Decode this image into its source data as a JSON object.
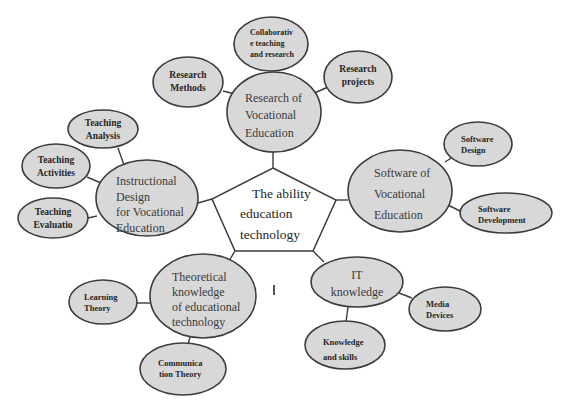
{
  "diagram": {
    "center": {
      "line1": "The  ability",
      "line2": "education",
      "line3": "technology"
    },
    "branches": {
      "research": {
        "line1": "Research of",
        "line2": "Vocational",
        "line3": "Education",
        "children": {
          "methods": {
            "line1": "Research",
            "line2": "Methods"
          },
          "collaborative": {
            "line1": "Collaborativ",
            "line2": "e teaching",
            "line3": "and research"
          },
          "projects": {
            "line1": "Research",
            "line2": "projects"
          }
        }
      },
      "software": {
        "line1": "Software of",
        "line2": "Vocational",
        "line3": "Education",
        "children": {
          "design": {
            "line1": "Software",
            "line2": "Design"
          },
          "development": {
            "line1": "Software",
            "line2": "Development"
          }
        }
      },
      "it": {
        "line1": "IT",
        "line2": "knowledge",
        "children": {
          "media": {
            "line1": "Media",
            "line2": "Devices"
          },
          "skills": {
            "line1": "Knowledge",
            "line2": "and skills"
          }
        }
      },
      "theoretical": {
        "line1": "Theoretical",
        "line2": "knowledge",
        "line3": "of educational",
        "line4": "technology",
        "children": {
          "learning": {
            "line1": "Learning",
            "line2": "Theory"
          },
          "communication": {
            "line1": "Communica",
            "line2": "tion Theory"
          }
        }
      },
      "instructional": {
        "line1": "Instructional",
        "line2": "Design",
        "line3": "for Vocational",
        "line4": "Education",
        "children": {
          "analysis": {
            "line1": "Teaching",
            "line2": "Analysis"
          },
          "activities": {
            "line1": "Teaching",
            "line2": "Activities"
          },
          "evaluation": {
            "line1": "Teaching",
            "line2": "Evaluatio"
          }
        }
      }
    },
    "colors": {
      "node_fill": "#d8d8d8",
      "stroke": "#3c3c3c",
      "text": "#2a2a2a",
      "background": "#ffffff"
    }
  }
}
